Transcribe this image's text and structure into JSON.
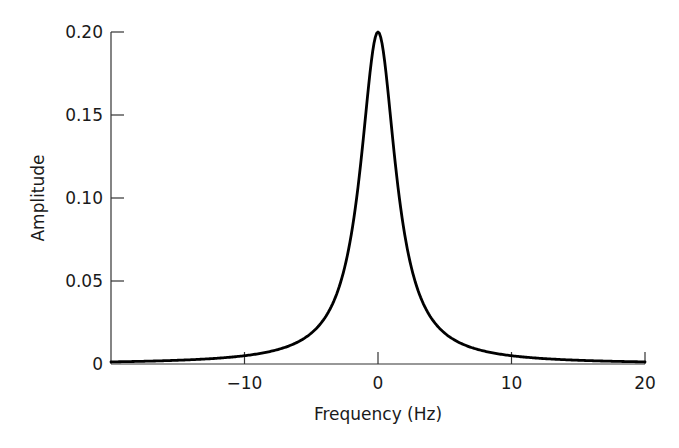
{
  "chart_data": {
    "type": "line",
    "title": "",
    "xlabel": "Frequency (Hz)",
    "ylabel": "Amplitude",
    "xlim": [
      -20,
      20
    ],
    "ylim": [
      0,
      0.2
    ],
    "grid": false,
    "legend": null,
    "x_ticks": [
      -10,
      0,
      10,
      20
    ],
    "x_tick_labels": [
      "−10",
      "0",
      "10",
      "20"
    ],
    "y_ticks": [
      0,
      0.05,
      0.1,
      0.15,
      0.2
    ],
    "y_tick_labels": [
      "0",
      "0.05",
      "0.10",
      "0.15",
      "0.20"
    ],
    "series": [
      {
        "name": "Lorentzian spectrum",
        "color": "#000000",
        "model": "A / (1 + (f/gamma)^2)",
        "peak_amplitude": 0.2,
        "center_hz": 0,
        "half_width_hz": 1.6,
        "x": [
          -20,
          -15,
          -10,
          -8,
          -6,
          -5,
          -4,
          -3,
          -2,
          -1.5,
          -1,
          -0.5,
          0,
          0.5,
          1,
          1.5,
          2,
          3,
          4,
          5,
          6,
          8,
          10,
          15,
          20
        ],
        "values": [
          0.0013,
          0.0022,
          0.005,
          0.0077,
          0.0133,
          0.0186,
          0.0276,
          0.0443,
          0.0762,
          0.1064,
          0.1438,
          0.1822,
          0.2,
          0.1822,
          0.1438,
          0.1064,
          0.0762,
          0.0443,
          0.0276,
          0.0186,
          0.0133,
          0.0077,
          0.005,
          0.0022,
          0.0013
        ]
      }
    ]
  },
  "labels": {
    "xlabel": "Frequency (Hz)",
    "ylabel": "Amplitude",
    "x_ticks": [
      "−10",
      "0",
      "10",
      "20"
    ],
    "y_ticks": [
      "0",
      "0.05",
      "0.10",
      "0.15",
      "0.20"
    ]
  }
}
